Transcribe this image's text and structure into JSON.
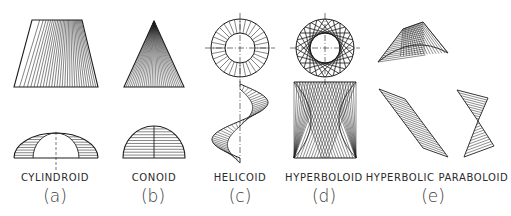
{
  "figure": {
    "ink_color": "#1e1e1e",
    "background": "#ffffff",
    "panels": [
      {
        "id": "a",
        "name": "CYLINDROID",
        "tag": "(a)",
        "label_x": 55,
        "tag_x": 55
      },
      {
        "id": "b",
        "name": "CONOID",
        "tag": "(b)",
        "label_x": 154,
        "tag_x": 153
      },
      {
        "id": "c",
        "name": "HELICOID",
        "tag": "(c)",
        "label_x": 240,
        "tag_x": 240
      },
      {
        "id": "d",
        "name": "HYPERBOLOID",
        "tag": "(d)",
        "label_x": 324,
        "tag_x": 324
      },
      {
        "id": "e",
        "name": "HYPERBOLIC PARABOLOID",
        "tag": "(e)",
        "label_x": 437,
        "tag_x": 433
      }
    ],
    "label_y": 181,
    "tag_y": 202,
    "geometry": {
      "cylindroid": {
        "top_trapezoid": {
          "top_left": [
            32,
            20
          ],
          "top_right": [
            82,
            20
          ],
          "bottom_left": [
            14,
            87
          ],
          "bottom_right": [
            98,
            87
          ],
          "rulings": 30
        },
        "bottom_view": {
          "cx": 56,
          "base_y": 158,
          "outer_rx": 42,
          "outer_ry": 25,
          "inner_rx": 23,
          "inner_ry": 25,
          "hatch_lines": 9,
          "axis_bottom": 170
        }
      },
      "conoid": {
        "top_triangle": {
          "apex": [
            154,
            21
          ],
          "base_left": [
            124,
            87
          ],
          "base_right": [
            184,
            87
          ],
          "rulings": 30
        },
        "bottom_view": {
          "cx": 154,
          "base_y": 158,
          "rx": 31,
          "ry": 32,
          "hatch_lines": 11
        }
      },
      "helicoid": {
        "plan": {
          "cx": 240,
          "cy": 48,
          "r_outer": 29,
          "r_inner": 15,
          "spokes": 32,
          "cross_ext": 35
        },
        "elevation": {
          "axis_x": 240,
          "top": 81,
          "bottom": 163,
          "amp": 28,
          "rulings": 40
        }
      },
      "hyperboloid": {
        "plan": {
          "cx": 325,
          "cy": 48,
          "r_outer": 29,
          "r_inner": 15,
          "chords": 24,
          "cross_ext": 35
        },
        "elevation": {
          "cx": 325,
          "top": 82,
          "bottom": 158,
          "half_width": 31,
          "waist": 14,
          "lines": 22
        }
      },
      "hyperbolic_paraboloid": {
        "top_saddle": {
          "p1": [
            378,
            62
          ],
          "p2": [
            403,
            29
          ],
          "p3": [
            423,
            22
          ],
          "p4": [
            448,
            53
          ],
          "rulings": 16
        },
        "parallelogram": {
          "a": [
            379,
            89
          ],
          "b": [
            405,
            99
          ],
          "c": [
            448,
            157
          ],
          "d": [
            423,
            148
          ],
          "hatch": 20
        },
        "bowtie": {
          "t1": [
            457,
            90
          ],
          "t2": [
            488,
            98
          ],
          "mid": [
            478,
            121
          ],
          "b1": [
            494,
            146
          ],
          "b2": [
            464,
            157
          ],
          "hatch_top": 11,
          "hatch_bottom": 11
        }
      }
    }
  }
}
